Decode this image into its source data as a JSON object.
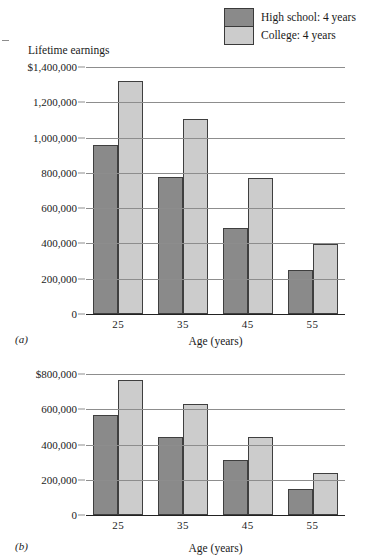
{
  "legend": {
    "items": [
      {
        "label": "High school: 4 years",
        "color": "#8a8a8a",
        "swatch_name": "legend-swatch-high-school"
      },
      {
        "label": "College: 4 years",
        "color": "#cccccc",
        "swatch_name": "legend-swatch-college"
      }
    ]
  },
  "panel_a": {
    "tag": "(a)",
    "y_axis_title": "Lifetime earnings",
    "x_axis_title": "Age (years)",
    "ytick_labels": [
      "$1,400,000",
      "1,200,000",
      "1,000,000",
      "800,000",
      "600,000",
      "400,000",
      "200,000",
      "0"
    ],
    "xtick_labels": [
      "25",
      "35",
      "45",
      "55"
    ]
  },
  "panel_b": {
    "tag": "(b)",
    "y_axis_title": "",
    "x_axis_title": "Age (years)",
    "ytick_labels": [
      "$800,000",
      "600,000",
      "400,000",
      "200,000",
      "0"
    ],
    "xtick_labels": [
      "25",
      "35",
      "45",
      "55"
    ]
  },
  "chart_data": [
    {
      "type": "bar",
      "panel": "(a)",
      "title": "",
      "ylabel": "Lifetime earnings",
      "xlabel": "Age (years)",
      "categories": [
        "25",
        "35",
        "45",
        "55"
      ],
      "series": [
        {
          "name": "High school: 4 years",
          "color": "#8a8a8a",
          "values": [
            960000,
            775000,
            490000,
            250000
          ]
        },
        {
          "name": "College: 4 years",
          "color": "#cccccc",
          "values": [
            1320000,
            1105000,
            770000,
            395000
          ]
        }
      ],
      "ylim": [
        0,
        1400000
      ],
      "ytick_values": [
        0,
        200000,
        400000,
        600000,
        800000,
        1000000,
        1200000,
        1400000
      ],
      "grid": true,
      "legend_position": "top-right"
    },
    {
      "type": "bar",
      "panel": "(b)",
      "title": "",
      "ylabel": "",
      "xlabel": "Age (years)",
      "categories": [
        "25",
        "35",
        "45",
        "55"
      ],
      "series": [
        {
          "name": "High school: 4 years",
          "color": "#8a8a8a",
          "values": [
            565000,
            440000,
            310000,
            150000
          ]
        },
        {
          "name": "College: 4 years",
          "color": "#cccccc",
          "values": [
            765000,
            630000,
            440000,
            240000
          ]
        }
      ],
      "ylim": [
        0,
        800000
      ],
      "ytick_values": [
        0,
        200000,
        400000,
        600000,
        800000
      ],
      "grid": true,
      "legend_position": "top-right"
    }
  ]
}
